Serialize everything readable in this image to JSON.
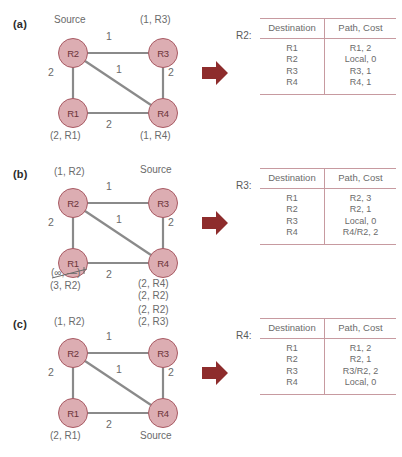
{
  "figure": {
    "type": "network-routing-diagram",
    "node_fill": "#dcadb2",
    "node_border": "#a85a63",
    "edge_color": "#8a8a8a",
    "arrow_color": "#8e2c2c",
    "table_rule_color": "#c79aa0"
  },
  "table_headers": {
    "destination": "Destination",
    "path_cost": "Path, Cost"
  },
  "panels": [
    {
      "id": "a",
      "label": "(a)",
      "graph": {
        "nodes": [
          {
            "id": "R2",
            "name": "R2"
          },
          {
            "id": "R3",
            "name": "R3"
          },
          {
            "id": "R1",
            "name": "R1"
          },
          {
            "id": "R4",
            "name": "R4"
          }
        ],
        "edges": [
          {
            "from": "R2",
            "to": "R3",
            "weight": "1"
          },
          {
            "from": "R2",
            "to": "R1",
            "weight": "2"
          },
          {
            "from": "R2",
            "to": "R4",
            "weight": "1"
          },
          {
            "from": "R3",
            "to": "R4",
            "weight": "2"
          },
          {
            "from": "R1",
            "to": "R4",
            "weight": "2"
          }
        ],
        "annotations": {
          "r2_top": "Source",
          "r3_top": "(1, R3)",
          "r1_bottom": "(2, R1)",
          "r4_bottom": "(1, R4)"
        }
      },
      "table": {
        "router": "R2:",
        "rows": [
          {
            "destination": "R1",
            "path_cost": "R1, 2"
          },
          {
            "destination": "R2",
            "path_cost": "Local, 0"
          },
          {
            "destination": "R3",
            "path_cost": "R3, 1"
          },
          {
            "destination": "R4",
            "path_cost": "R4, 1"
          }
        ]
      }
    },
    {
      "id": "b",
      "label": "(b)",
      "graph": {
        "nodes": [
          {
            "id": "R2",
            "name": "R2"
          },
          {
            "id": "R3",
            "name": "R3"
          },
          {
            "id": "R1",
            "name": "R1"
          },
          {
            "id": "R4",
            "name": "R4"
          }
        ],
        "edges": [
          {
            "from": "R2",
            "to": "R3",
            "weight": "1"
          },
          {
            "from": "R2",
            "to": "R1",
            "weight": "2"
          },
          {
            "from": "R2",
            "to": "R4",
            "weight": "1"
          },
          {
            "from": "R3",
            "to": "R4",
            "weight": "2"
          },
          {
            "from": "R1",
            "to": "R4",
            "weight": "2"
          }
        ],
        "annotations": {
          "r2_top": "(1, R2)",
          "r3_top": "Source",
          "r1_bottom_struck": "(∞, —)",
          "r1_bottom": "(3, R2)",
          "r4_bottom_1": "(2, R4)",
          "r4_bottom_2": "(2, R2)"
        }
      },
      "table": {
        "router": "R3:",
        "rows": [
          {
            "destination": "R1",
            "path_cost": "R2, 3"
          },
          {
            "destination": "R2",
            "path_cost": "R2, 1"
          },
          {
            "destination": "R3",
            "path_cost": "Local, 0"
          },
          {
            "destination": "R4",
            "path_cost": "R4/R2, 2"
          }
        ]
      }
    },
    {
      "id": "c",
      "label": "(c)",
      "graph": {
        "nodes": [
          {
            "id": "R2",
            "name": "R2"
          },
          {
            "id": "R3",
            "name": "R3"
          },
          {
            "id": "R1",
            "name": "R1"
          },
          {
            "id": "R4",
            "name": "R4"
          }
        ],
        "edges": [
          {
            "from": "R2",
            "to": "R3",
            "weight": "1"
          },
          {
            "from": "R2",
            "to": "R1",
            "weight": "2"
          },
          {
            "from": "R2",
            "to": "R4",
            "weight": "1"
          },
          {
            "from": "R3",
            "to": "R4",
            "weight": "2"
          },
          {
            "from": "R1",
            "to": "R4",
            "weight": "2"
          }
        ],
        "annotations": {
          "r2_top": "(1, R2)",
          "r3_top_1": "(2, R2)",
          "r3_top_2": "(2, R3)",
          "r1_bottom": "(2, R1)",
          "r4_bottom": "Source"
        }
      },
      "table": {
        "router": "R4:",
        "rows": [
          {
            "destination": "R1",
            "path_cost": "R1, 2"
          },
          {
            "destination": "R2",
            "path_cost": "R2, 1"
          },
          {
            "destination": "R3",
            "path_cost": "R3/R2, 2"
          },
          {
            "destination": "R4",
            "path_cost": "Local, 0"
          }
        ]
      }
    }
  ]
}
